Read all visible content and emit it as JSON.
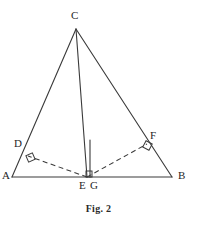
{
  "figure": {
    "caption": "Fig. 2",
    "background_color": "#ffffff",
    "stroke_color": "#3a3a3a",
    "label_color": "#262626",
    "labels": [
      {
        "text": "C",
        "x": 71,
        "y": 10
      },
      {
        "text": "D",
        "x": 14,
        "y": 138
      },
      {
        "text": "F",
        "x": 150,
        "y": 130
      },
      {
        "text": "A",
        "x": 2,
        "y": 170
      },
      {
        "text": "B",
        "x": 178,
        "y": 170
      },
      {
        "text": "E",
        "x": 79,
        "y": 180
      },
      {
        "text": "G",
        "x": 90,
        "y": 180
      }
    ],
    "points": {
      "A": {
        "x": 12,
        "y": 177
      },
      "B": {
        "x": 172,
        "y": 177
      },
      "C": {
        "x": 76,
        "y": 29
      },
      "D": {
        "x": 28,
        "y": 156
      },
      "E": {
        "x": 87,
        "y": 177
      },
      "F": {
        "x": 147,
        "y": 144
      },
      "G": {
        "x": 90,
        "y": 177
      }
    },
    "solid_segments": [
      {
        "name": "side-AB",
        "x1": 12,
        "y1": 177,
        "x2": 172,
        "y2": 177
      },
      {
        "name": "side-AC",
        "x1": 12,
        "y1": 177,
        "x2": 76,
        "y2": 29
      },
      {
        "name": "side-BC",
        "x1": 172,
        "y1": 177,
        "x2": 76,
        "y2": 29
      },
      {
        "name": "cevian-CE",
        "x1": 76,
        "y1": 29,
        "x2": 87,
        "y2": 177
      },
      {
        "name": "segment-CG",
        "x1": 90,
        "y1": 140,
        "x2": 90,
        "y2": 177
      }
    ],
    "dashed_segments": [
      {
        "name": "perpendicular-ED",
        "x1": 87,
        "y1": 177,
        "x2": 28,
        "y2": 156
      },
      {
        "name": "perpendicular-EF",
        "x1": 87,
        "y1": 177,
        "x2": 147,
        "y2": 144
      }
    ],
    "right_angle_marks": [
      {
        "name": "right-angle-at-D",
        "x": 27,
        "y": 154,
        "rotation": -23,
        "size": 7
      },
      {
        "name": "right-angle-at-F",
        "x": 144,
        "y": 142,
        "rotation": 28,
        "size": 7
      },
      {
        "name": "right-angle-at-G",
        "x": 86,
        "y": 171,
        "rotation": 0,
        "size": 6
      }
    ]
  }
}
